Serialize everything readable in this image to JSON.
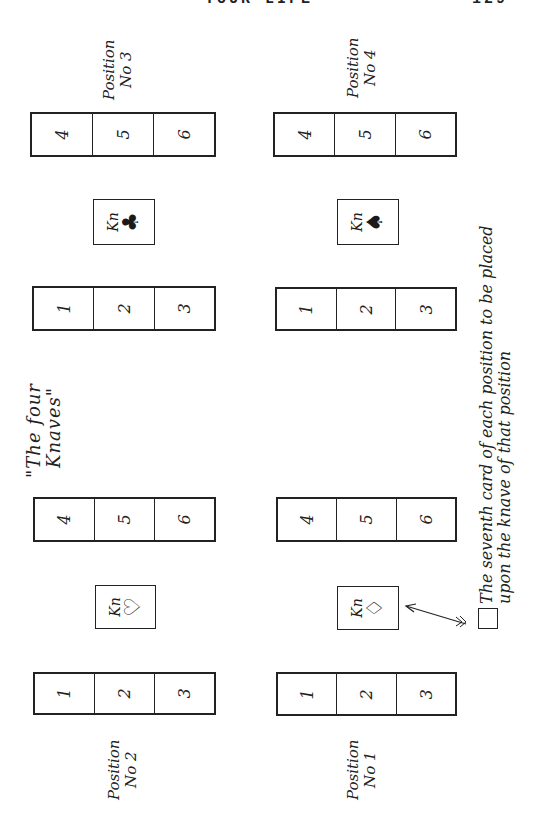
{
  "page": {
    "running_head": "YOUR LIFE",
    "page_number": "129"
  },
  "diagram": {
    "title_line1": "\"The four",
    "title_line2": "Knaves\"",
    "positions": [
      {
        "id": 1,
        "label_line1": "Position",
        "label_line2": "No 1",
        "knave": "Kn",
        "suit": "diamond",
        "suit_glyph": "♢",
        "upper_cells": [
          "4",
          "5",
          "6"
        ],
        "lower_cells": [
          "1",
          "2",
          "3"
        ]
      },
      {
        "id": 2,
        "label_line1": "Position",
        "label_line2": "No 2",
        "knave": "Kn",
        "suit": "heart",
        "suit_glyph": "♡",
        "upper_cells": [
          "4",
          "5",
          "6"
        ],
        "lower_cells": [
          "1",
          "2",
          "3"
        ]
      },
      {
        "id": 3,
        "label_line1": "Position",
        "label_line2": "No 3",
        "knave": "Kn",
        "suit": "club",
        "suit_glyph": "♣",
        "upper_cells": [
          "4",
          "5",
          "6"
        ],
        "lower_cells": [
          "1",
          "2",
          "3"
        ]
      },
      {
        "id": 4,
        "label_line1": "Position",
        "label_line2": "No 4",
        "knave": "Kn",
        "suit": "spade",
        "suit_glyph": "♠",
        "upper_cells": [
          "4",
          "5",
          "6"
        ],
        "lower_cells": [
          "1",
          "2",
          "3"
        ]
      }
    ],
    "legend": {
      "line1": "The seventh card of each position to be placed",
      "line2": "upon the knave of that position"
    }
  }
}
